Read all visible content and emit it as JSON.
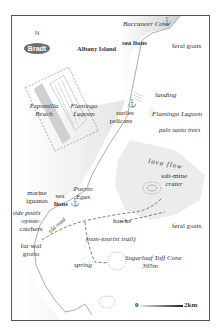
{
  "map": {
    "publisher_logo": "Bradt",
    "north_label": "N",
    "islands": [
      "Albany Island"
    ],
    "places": {
      "buccaneer_cove": "Buccaneer Cove",
      "espumilla_beach_1": "Espumilla",
      "espumilla_beach_2": "Beach",
      "flamingo_lagoon_inset_1": "Flamingo",
      "flamingo_lagoon_inset_2": "Lagoon",
      "flamingo_lagoon": "Flamingo Lagoon",
      "puerto_egas_1": "Puerto",
      "puerto_egas_2": "Egas",
      "salt_mine_crater_1": "salt-mine",
      "salt_mine_crater_2": "crater",
      "sugarloaf_1": "Sugarloaf Tuff Cone",
      "sugarloaf_2": "395m",
      "lava_flow": "lava flow",
      "landing": "landing",
      "spring": "spring",
      "tide_pools": "tide pools",
      "fur_seal_grotto_1": "fur seal",
      "fur_seal_grotto_2": "grotto"
    },
    "wildlife": {
      "sea_lions_top": "sea lions",
      "feral_goats_top": "feral goats",
      "turtles": "turtles",
      "pelicans": "pelicans",
      "palo_santo": "palo santo trees",
      "marine_iguanas_1": "marine",
      "marine_iguanas_2": "iguanas",
      "sea_lions_1": "sea",
      "sea_lions_2": "lions",
      "oystercatchers_1": "oyster-",
      "oystercatchers_2": "catchers",
      "hawks": "hawks",
      "feral_goats_bottom": "feral goats"
    },
    "trails": {
      "old_road": "old road",
      "non_tourist_trail": "(non-tourist trail)"
    },
    "scale": {
      "start": "0",
      "end": "2km"
    },
    "icons": [
      "anchor-icon",
      "anchor-icon",
      "anchor-icon",
      "compass-north-icon"
    ],
    "colors": {
      "land_shade": "#d9d9d9",
      "lava": "#ececec",
      "line": "#555555",
      "trail": "#777777"
    }
  }
}
